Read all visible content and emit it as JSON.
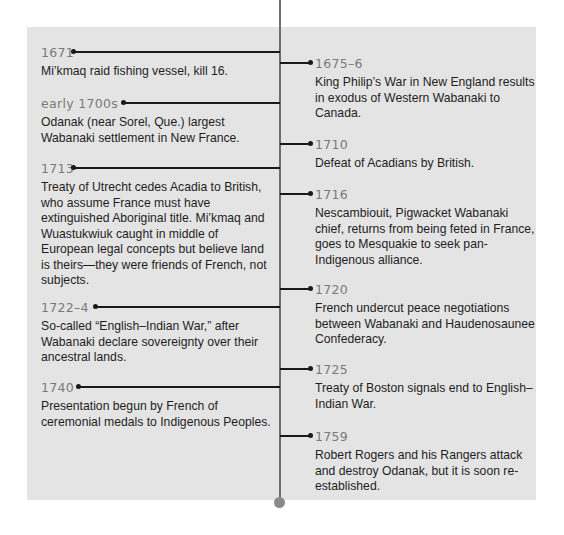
{
  "timeline": {
    "left": [
      {
        "year": "1671",
        "desc": "Mi’kmaq raid fishing vessel, kill 16."
      },
      {
        "year": "early 1700s",
        "desc": "Odanak (near Sorel, Que.) largest Wabanaki settlement in New France."
      },
      {
        "year": "1713",
        "desc": "Treaty of Utrecht cedes Acadia to British, who assume France must have extinguished Aboriginal title. Mi’kmaq and Wuastukwiuk caught in middle of European legal concepts but believe land is theirs—they were friends of French, not subjects."
      },
      {
        "year": "1722–4",
        "desc": "So-called “English–Indian War,” after Wabanaki declare sovereignty over their ancestral lands."
      },
      {
        "year": "1740",
        "desc": "Presentation begun by French of ceremonial medals to Indigenous Peoples."
      }
    ],
    "right": [
      {
        "year": "1675–6",
        "desc": "King Philip’s War in New England results in exodus of Western Wabanaki to Canada."
      },
      {
        "year": "1710",
        "desc": "Defeat of Acadians by British."
      },
      {
        "year": "1716",
        "desc": "Nescambiouit, Pigwacket Wabanaki chief, returns from being feted in France, goes to Mesquakie to seek pan-Indigenous alliance."
      },
      {
        "year": "1720",
        "desc": "French undercut peace negotiations between Wabanaki and Haudenosaunee Confederacy."
      },
      {
        "year": "1725",
        "desc": "Treaty of Boston signals end to English–Indian War."
      },
      {
        "year": "1759",
        "desc": "Robert Rogers and his Rangers attack and destroy Odanak, but it is soon re-established."
      }
    ]
  },
  "colors": {
    "panel": "#e4e4e4",
    "spine": "#6e6e6e",
    "year_text": "#7a7a7a",
    "body_text": "#1e1e1e"
  }
}
